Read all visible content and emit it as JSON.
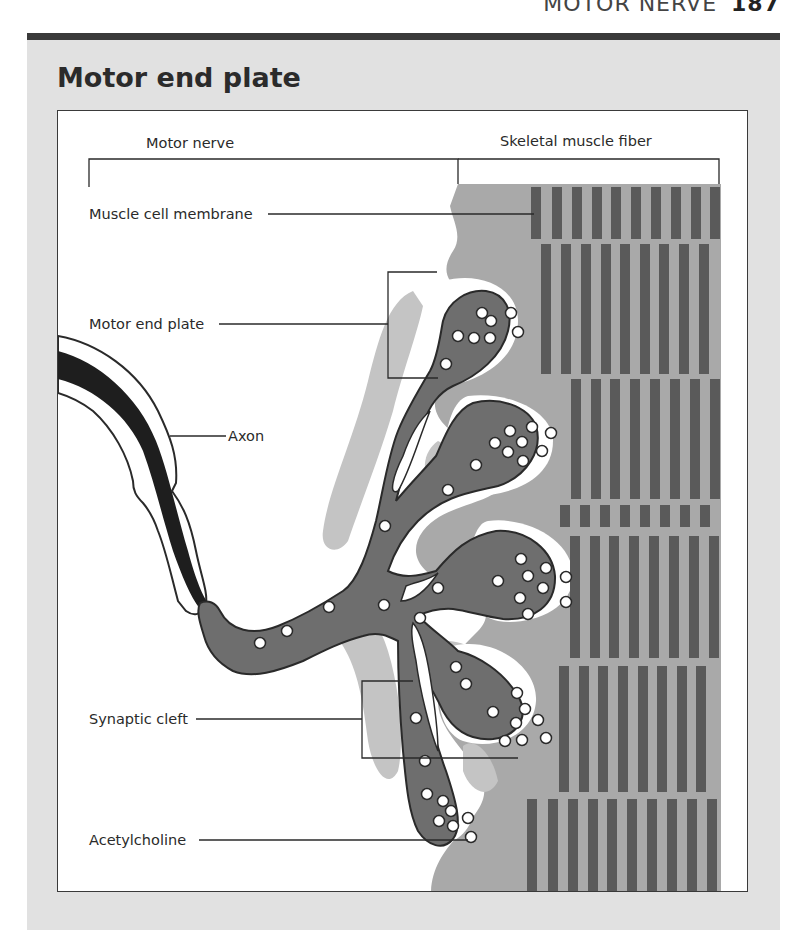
{
  "running_head": {
    "section": "MOTOR NERVE",
    "page_number": "187"
  },
  "title": "Motor end plate",
  "figure": {
    "labels": {
      "motor_nerve": "Motor nerve",
      "skeletal_muscle_fiber": "Skeletal muscle fiber",
      "muscle_cell_membrane": "Muscle cell membrane",
      "motor_end_plate": "Motor end plate",
      "axon": "Axon",
      "synaptic_cleft": "Synaptic cleft",
      "acetylcholine": "Acetylcholine"
    },
    "colors": {
      "panel_background": "#e1e1e1",
      "muscle_sarcoplasm": "#a9a9a9",
      "striation_band": "#5a5a5a",
      "nerve_terminal": "#6e6e6e",
      "axon_core": "#1e1e1e",
      "outline": "#2a2a2a"
    }
  }
}
